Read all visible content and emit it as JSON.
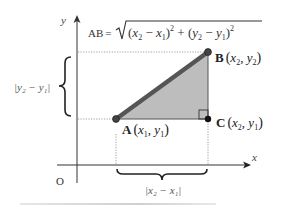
{
  "diagram": {
    "formula": {
      "lhs": "AB",
      "equals": "=",
      "radicand": [
        "(",
        "x",
        "2",
        " − ",
        "x",
        "1",
        ")",
        "2",
        " + ",
        "(",
        "y",
        "2",
        " − ",
        "y",
        "1",
        ")",
        "2"
      ],
      "text": "AB = √((x₂ − x₁)² + (y₂ − y₁)²)"
    },
    "axes": {
      "x_label": "x",
      "y_label": "y",
      "origin_label": "O"
    },
    "points": {
      "A": {
        "name": "A",
        "coords": "(x₁, y₁)",
        "var1": "x",
        "sub1": "1",
        "var2": "y",
        "sub2": "1"
      },
      "B": {
        "name": "B",
        "coords": "(x₂, y₂)",
        "var1": "x",
        "sub1": "2",
        "var2": "y",
        "sub2": "2"
      },
      "C": {
        "name": "C",
        "coords": "(x₂, y₁)",
        "var1": "x",
        "sub1": "2",
        "var2": "y",
        "sub2": "1"
      }
    },
    "vertical_distance_label": "|y₂ − y₁|",
    "horizontal_distance_label": "|x₂ − x₁|",
    "colors": {
      "triangle_fill": "#bdbdbd",
      "hypotenuse": "#555555",
      "axis": "#333333",
      "guide": "#888888",
      "text": "#222222"
    }
  }
}
